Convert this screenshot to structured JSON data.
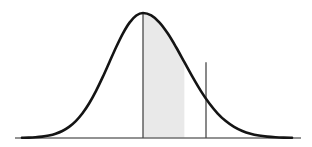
{
  "figure": {
    "name": "normal-distribution-shaded-area",
    "background_color": "#ffffff",
    "width": 312,
    "height": 147
  },
  "chart_data": {
    "type": "area",
    "title": "",
    "subtitle": "",
    "xlabel": "",
    "ylabel": "",
    "grid": false,
    "legend": null,
    "legend_position": "none",
    "distribution": "normal",
    "mean": 0,
    "std_dev": 1,
    "xlim": [
      -3.6,
      3.6
    ],
    "ylim": [
      0,
      1
    ],
    "shaded_interval": [
      0,
      1.0
    ],
    "shade_fill_color": "#e9e9e9",
    "curve_color": "#141414",
    "curve_stroke_width": 2.6,
    "axis_color": "#6e6e6e",
    "axis_stroke_width": 1.6,
    "boundary_color": "#4a4a4a",
    "boundary_stroke_width": 1.3,
    "tick_labels": [],
    "annotations": [],
    "x": [
      -3.6,
      -3.4,
      -3.2,
      -3.0,
      -2.8,
      -2.6,
      -2.4,
      -2.2,
      -2.0,
      -1.8,
      -1.6,
      -1.4,
      -1.2,
      -1.0,
      -0.8,
      -0.6,
      -0.4,
      -0.2,
      0.0,
      0.2,
      0.4,
      0.6,
      0.8,
      1.0,
      1.2,
      1.4,
      1.6,
      1.8,
      2.0,
      2.2,
      2.4,
      2.6,
      2.8,
      3.0,
      3.2,
      3.4,
      3.6
    ],
    "values": [
      0.0015,
      0.003,
      0.006,
      0.0111,
      0.0198,
      0.034,
      0.0561,
      0.0889,
      0.1353,
      0.1979,
      0.278,
      0.3753,
      0.4868,
      0.6065,
      0.7261,
      0.8353,
      0.9231,
      0.9802,
      1.0,
      0.9802,
      0.9231,
      0.8353,
      0.7261,
      0.6065,
      0.4868,
      0.3753,
      0.278,
      0.1979,
      0.1353,
      0.0889,
      0.0561,
      0.034,
      0.0198,
      0.0111,
      0.006,
      0.003,
      0.0015
    ],
    "geometry": {
      "baseline_y": 138,
      "baseline_x_start": 15,
      "baseline_x_end": 301,
      "peak_x": 143,
      "peak_y": 13,
      "left_boundary_x": 143,
      "right_boundary_x": 206,
      "right_boundary_top_y": 95,
      "curve_left_x": 22,
      "curve_right_x": 292
    }
  }
}
